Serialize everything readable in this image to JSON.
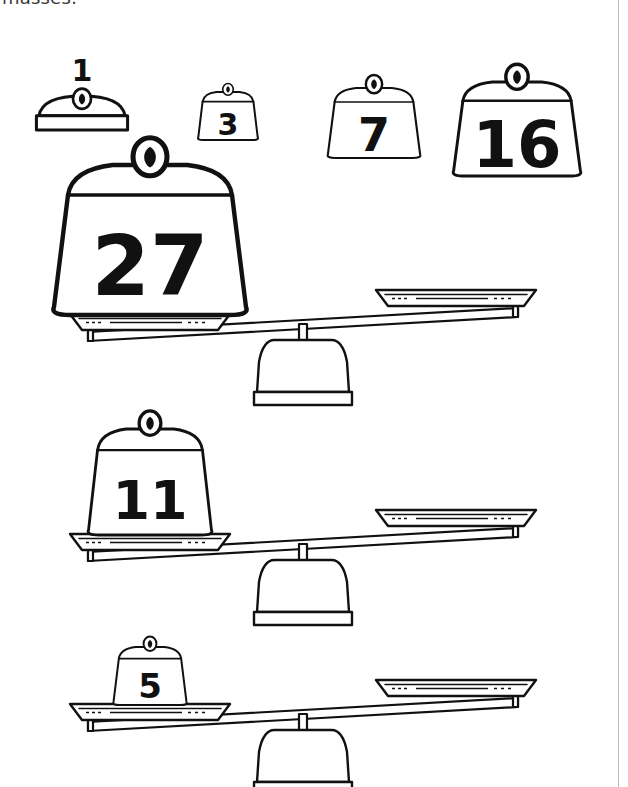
{
  "heading": {
    "clipped_text": "masses:"
  },
  "colors": {
    "ink": "#111111",
    "paper": "#ffffff",
    "scan_edge": "#b9b9b9"
  },
  "weight_legend": {
    "name": "available-masses-row",
    "items": [
      {
        "value": "1",
        "label_position": "above",
        "shape": "flat-dome",
        "x": 82,
        "y": 96,
        "w": 86,
        "h": 34,
        "font": 30
      },
      {
        "value": "3",
        "label_position": "inside",
        "shape": "trapezoid",
        "x": 228,
        "y": 92,
        "w": 62,
        "h": 48,
        "font": 30
      },
      {
        "value": "7",
        "label_position": "inside",
        "shape": "trapezoid",
        "x": 374,
        "y": 88,
        "w": 96,
        "h": 70,
        "font": 46
      },
      {
        "value": "16",
        "label_position": "inside",
        "shape": "trapezoid",
        "x": 517,
        "y": 82,
        "w": 132,
        "h": 94,
        "font": 64
      }
    ]
  },
  "balances": [
    {
      "name": "balance-1",
      "left_weight": {
        "value": "27",
        "w": 200,
        "h": 150,
        "font": 84
      },
      "right_weight": null,
      "tilt": "left-down",
      "pivot_x": 303,
      "beam_y": 320
    },
    {
      "name": "balance-2",
      "left_weight": {
        "value": "11",
        "w": 128,
        "h": 106,
        "font": 54
      },
      "right_weight": null,
      "tilt": "left-down",
      "pivot_x": 303,
      "beam_y": 540
    },
    {
      "name": "balance-3",
      "left_weight": {
        "value": "5",
        "w": 76,
        "h": 58,
        "font": 34
      },
      "right_weight": null,
      "tilt": "left-down",
      "pivot_x": 303,
      "beam_y": 710
    }
  ],
  "icons": {
    "knob": "weight-handle-icon"
  }
}
